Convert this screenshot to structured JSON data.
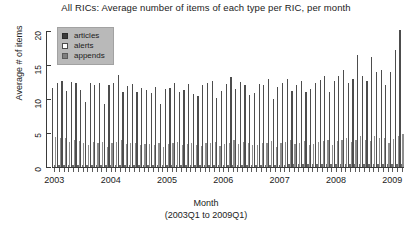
{
  "chart_data": {
    "type": "bar",
    "title": "All RICs: Average number of items of each type per RIC, per month",
    "xlabel": "Month",
    "xlabel_sub": "(2003Q1 to 2009Q1)",
    "ylabel": "Average # of items",
    "ylim": [
      0,
      20
    ],
    "yticks": [
      0,
      5,
      10,
      15,
      20
    ],
    "xticks": [
      "2003",
      "2004",
      "2005",
      "2006",
      "2007",
      "2008",
      "2009"
    ],
    "grid": false,
    "legend_position": "top-left",
    "legend": [
      "articles",
      "alerts",
      "appends"
    ],
    "colors": {
      "articles": "#4d4d4d",
      "alerts": "#ffffff",
      "appends": "#8f8f8f",
      "axis": "#3a3a3a",
      "legend_background": "#b9b9b9"
    },
    "x": [
      "2003Q1",
      "2003-02",
      "2003-03",
      "2003-04",
      "2003-05",
      "2003-06",
      "2003-07",
      "2003-08",
      "2003-09",
      "2003-10",
      "2003-11",
      "2003-12",
      "2004-01",
      "2004-02",
      "2004-03",
      "2004-04",
      "2004-05",
      "2004-06",
      "2004-07",
      "2004-08",
      "2004-09",
      "2004-10",
      "2004-11",
      "2004-12",
      "2005-01",
      "2005-02",
      "2005-03",
      "2005-04",
      "2005-05",
      "2005-06",
      "2005-07",
      "2005-08",
      "2005-09",
      "2005-10",
      "2005-11",
      "2005-12",
      "2006-01",
      "2006-02",
      "2006-03",
      "2006-04",
      "2006-05",
      "2006-06",
      "2006-07",
      "2006-08",
      "2006-09",
      "2006-10",
      "2006-11",
      "2006-12",
      "2007-01",
      "2007-02",
      "2007-03",
      "2007-04",
      "2007-05",
      "2007-06",
      "2007-07",
      "2007-08",
      "2007-09",
      "2007-10",
      "2007-11",
      "2007-12",
      "2008-01",
      "2008-02",
      "2008-03",
      "2008-04",
      "2008-05",
      "2008-06",
      "2008-07",
      "2008-08",
      "2008-09",
      "2008-10",
      "2008-11",
      "2008-12",
      "2009-01",
      "2009-02",
      "2009Q1"
    ],
    "series": [
      {
        "name": "articles",
        "values": [
          11.6,
          12.4,
          12.6,
          11.2,
          12.5,
          12.4,
          11.3,
          9.6,
          12.3,
          12.0,
          12.4,
          9.3,
          12.0,
          12.3,
          13.5,
          11.0,
          11.9,
          12.2,
          11.1,
          11.6,
          11.3,
          10.9,
          11.8,
          9.2,
          11.4,
          11.6,
          12.4,
          11.0,
          11.3,
          12.2,
          10.8,
          10.4,
          12.0,
          12.3,
          12.6,
          10.2,
          11.2,
          12.2,
          13.2,
          11.4,
          12.5,
          12.0,
          10.6,
          10.9,
          12.2,
          12.0,
          13.0,
          10.0,
          11.8,
          12.4,
          13.0,
          11.2,
          12.0,
          12.6,
          11.0,
          11.4,
          12.3,
          12.8,
          13.4,
          11.0,
          12.6,
          13.4,
          14.2,
          12.4,
          13.0,
          16.4,
          13.4,
          12.6,
          16.2,
          14.0,
          14.3,
          12.0,
          13.9,
          17.2,
          20.2
        ]
      },
      {
        "name": "alerts",
        "values": [
          0.3,
          0.3,
          0.3,
          0.3,
          0.3,
          0.3,
          0.3,
          0.3,
          0.3,
          0.3,
          0.3,
          0.3,
          0.3,
          0.3,
          0.3,
          0.3,
          0.3,
          0.3,
          0.3,
          0.3,
          0.3,
          0.3,
          0.3,
          0.3,
          0.3,
          0.3,
          0.3,
          0.3,
          0.3,
          0.3,
          0.3,
          0.3,
          0.3,
          0.3,
          0.3,
          0.3,
          0.3,
          0.3,
          0.3,
          0.3,
          0.3,
          0.3,
          0.3,
          0.3,
          0.3,
          0.3,
          0.3,
          0.3,
          0.3,
          0.3,
          0.4,
          0.4,
          0.4,
          0.4,
          0.4,
          0.4,
          0.4,
          0.4,
          0.4,
          0.4,
          0.4,
          0.4,
          0.4,
          0.4,
          0.4,
          0.5,
          0.4,
          0.4,
          0.5,
          0.4,
          0.4,
          0.4,
          0.4,
          0.5,
          0.5
        ]
      },
      {
        "name": "appends",
        "values": [
          4.4,
          4.3,
          4.2,
          3.7,
          3.9,
          3.8,
          3.5,
          3.2,
          3.7,
          3.6,
          3.7,
          3.0,
          3.6,
          3.7,
          3.9,
          3.4,
          3.5,
          3.6,
          3.3,
          3.4,
          3.4,
          3.3,
          3.5,
          2.9,
          3.4,
          3.5,
          3.7,
          3.3,
          3.4,
          3.6,
          3.2,
          3.1,
          3.5,
          3.6,
          3.7,
          3.1,
          3.4,
          3.6,
          3.9,
          3.4,
          3.7,
          3.6,
          3.2,
          3.3,
          3.6,
          3.6,
          3.8,
          3.0,
          3.5,
          3.7,
          3.9,
          3.4,
          3.6,
          3.8,
          3.3,
          3.4,
          3.7,
          3.8,
          4.0,
          3.3,
          3.8,
          4.0,
          4.2,
          3.7,
          3.9,
          4.6,
          4.0,
          3.8,
          4.5,
          4.2,
          4.3,
          3.6,
          4.1,
          4.6,
          4.9
        ]
      }
    ]
  }
}
